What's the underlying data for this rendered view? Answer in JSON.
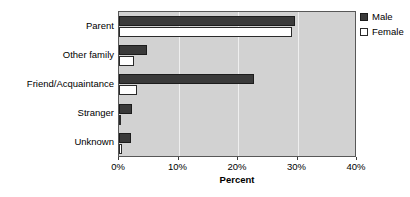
{
  "chart_data": {
    "type": "bar",
    "orientation": "horizontal",
    "title": "",
    "xlabel": "Percent",
    "ylabel": "",
    "xlim": [
      0,
      40
    ],
    "xticks": [
      "0%",
      "10%",
      "20%",
      "30%",
      "40%"
    ],
    "xtick_values": [
      0,
      10,
      20,
      30,
      40
    ],
    "grid": true,
    "legend_position": "right",
    "categories": [
      "Parent",
      "Other family",
      "Friend/Acquaintance",
      "Stranger",
      "Unknown"
    ],
    "series": [
      {
        "name": "Male",
        "color": "#3a3a3a",
        "values": [
          29.5,
          4.7,
          22.7,
          2.2,
          2.0
        ]
      },
      {
        "name": "Female",
        "color": "#ffffff",
        "values": [
          29.0,
          2.5,
          3.0,
          0.2,
          0.5
        ]
      }
    ]
  },
  "legend": {
    "items": [
      {
        "label": "Male",
        "swatch": "male-swatch"
      },
      {
        "label": "Female",
        "swatch": "female-swatch"
      }
    ]
  },
  "axis": {
    "x_title": "Percent"
  }
}
